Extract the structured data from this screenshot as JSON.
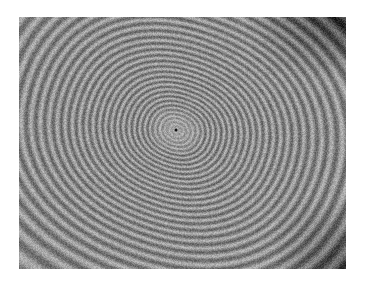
{
  "image": {
    "subject": "interference fringe pattern (Newton's rings)",
    "colormap": "grayscale",
    "background_color": "#ffffff"
  }
}
